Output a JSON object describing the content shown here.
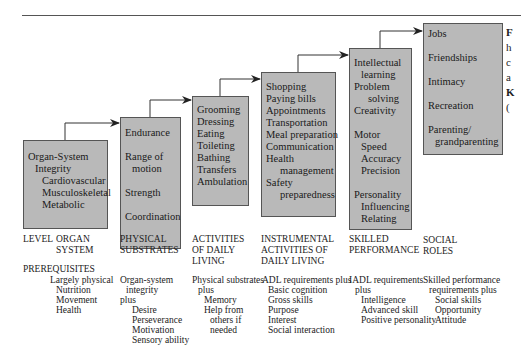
{
  "figure": {
    "boxes": [
      {
        "id": "organ-system",
        "lines": [
          {
            "t": "Organ-System",
            "lvl": 0
          },
          {
            "t": "Integrity",
            "lvl": 1
          },
          {
            "t": "Cardiovascular",
            "lvl": 2
          },
          {
            "t": "Musculoskeletal",
            "lvl": 2
          },
          {
            "t": "Metabolic",
            "lvl": 2
          }
        ]
      },
      {
        "id": "physical-substrates",
        "lines": [
          {
            "t": "Endurance",
            "lvl": 0
          },
          {
            "gap": true
          },
          {
            "t": "Range of",
            "lvl": 0
          },
          {
            "t": "motion",
            "lvl": 1
          },
          {
            "gap": true
          },
          {
            "t": "Strength",
            "lvl": 0
          },
          {
            "gap": true
          },
          {
            "t": "Coordination",
            "lvl": 0
          }
        ]
      },
      {
        "id": "adl",
        "lines": [
          {
            "t": "Grooming",
            "lvl": 0
          },
          {
            "t": "Dressing",
            "lvl": 0
          },
          {
            "t": "Eating",
            "lvl": 0
          },
          {
            "t": "Toileting",
            "lvl": 0
          },
          {
            "t": "Bathing",
            "lvl": 0
          },
          {
            "t": "Transfers",
            "lvl": 0
          },
          {
            "t": "Ambulation",
            "lvl": 0
          }
        ]
      },
      {
        "id": "iadl",
        "lines": [
          {
            "t": "Shopping",
            "lvl": 0
          },
          {
            "t": "Paying bills",
            "lvl": 0
          },
          {
            "t": "Appointments",
            "lvl": 0
          },
          {
            "t": "Transportation",
            "lvl": 0
          },
          {
            "t": "Meal preparation",
            "lvl": 0
          },
          {
            "t": "Communication",
            "lvl": 0
          },
          {
            "t": "Health",
            "lvl": 0
          },
          {
            "t": "management",
            "lvl": 2
          },
          {
            "t": "Safety",
            "lvl": 0
          },
          {
            "t": "preparedness",
            "lvl": 2
          }
        ]
      },
      {
        "id": "skilled-performance",
        "lines": [
          {
            "t": "Intellectual",
            "lvl": 0
          },
          {
            "t": "learning",
            "lvl": 1
          },
          {
            "t": "Problem",
            "lvl": 0
          },
          {
            "t": "solving",
            "lvl": 2
          },
          {
            "t": "Creativity",
            "lvl": 0
          },
          {
            "gap": true
          },
          {
            "t": "Motor",
            "lvl": 0
          },
          {
            "t": "Speed",
            "lvl": 1
          },
          {
            "t": "Accuracy",
            "lvl": 1
          },
          {
            "t": "Precision",
            "lvl": 1
          },
          {
            "gap": true
          },
          {
            "t": "Personality",
            "lvl": 0
          },
          {
            "t": "Influencing",
            "lvl": 1
          },
          {
            "t": "Relating",
            "lvl": 1
          }
        ]
      },
      {
        "id": "social-roles",
        "lines": [
          {
            "t": "Jobs",
            "lvl": 0
          },
          {
            "gap": true
          },
          {
            "t": "Friendships",
            "lvl": 0
          },
          {
            "gap": true
          },
          {
            "t": "Intimacy",
            "lvl": 0
          },
          {
            "gap": true
          },
          {
            "t": "Recreation",
            "lvl": 0
          },
          {
            "gap": true
          },
          {
            "t": "Parenting/",
            "lvl": 0
          },
          {
            "t": "grandparenting",
            "lvl": 1
          }
        ]
      }
    ],
    "level_label": "LEVEL",
    "levels": [
      {
        "name": "ORGAN\nSYSTEM"
      },
      {
        "name": "PHYSICAL\nSUBSTRATES"
      },
      {
        "name": "ACTIVITIES\nOF DAILY\nLIVING"
      },
      {
        "name": "INSTRUMENTAL\nACTIVITIES OF\nDAILY LIVING"
      },
      {
        "name": "SKILLED\nPERFORMANCE"
      },
      {
        "name": "SOCIAL\nROLES"
      }
    ],
    "prerequisites_label": "PREREQUISITES",
    "prerequisites": [
      [
        "Largely physical",
        "  Nutrition",
        "  Movement",
        "  Health"
      ],
      [
        "Organ-system",
        "  integrity",
        "plus",
        "    Desire",
        "    Perseverance",
        "    Motivation",
        "    Sensory ability"
      ],
      [
        "Physical substrates",
        "  plus",
        "    Memory",
        "    Help from",
        "      others if",
        "      needed"
      ],
      [
        "ADL requirements plus",
        "  Basic cognition",
        "  Gross skills",
        "  Purpose",
        "  Interest",
        "  Social interaction"
      ],
      [
        "IADL requirements",
        "  plus",
        "    Intelligence",
        "    Advanced skill",
        "    Positive personality"
      ],
      [
        "Skilled performance",
        "  requirements plus",
        "    Social skills",
        "    Opportunity",
        "    Attitude"
      ]
    ],
    "caption_fragments": [
      "F",
      "h",
      "c",
      "a",
      "K",
      "("
    ],
    "colors": {
      "box_fill": "#b9b9b9",
      "box_border": "#555555",
      "arrow": "#222222",
      "text": "#222222"
    }
  }
}
